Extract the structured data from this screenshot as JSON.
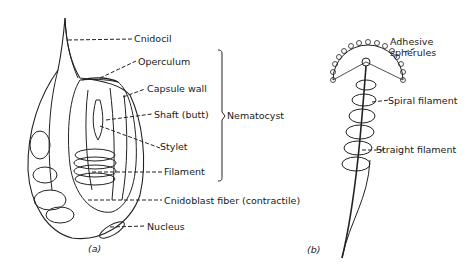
{
  "figure": {
    "panel_a": {
      "caption": "(a)",
      "labels": {
        "cnidocil": "Cnidocil",
        "operculum": "Operculum",
        "capsule_wall": "Capsule wall",
        "shaft": "Shaft (butt)",
        "stylet": "Stylet",
        "filament": "Filament",
        "cnidoblast_fiber": "Cnidoblast fiber (contractile)",
        "nucleus": "Nucleus"
      },
      "bracket_label": "Nematocyst"
    },
    "panel_b": {
      "caption": "(b)",
      "labels": {
        "adhesive_1": "Adhesive",
        "adhesive_2": "spherules",
        "spiral_filament": "Spiral filament",
        "straight_filament": "Straight filament"
      }
    }
  }
}
